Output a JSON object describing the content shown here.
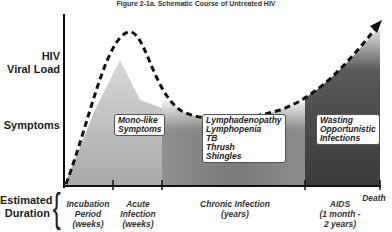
{
  "title": "Figure 2-1a. Schematic Course of Untreated HIV",
  "y_labels": {
    "viral_load": [
      "HIV",
      "Viral Load"
    ],
    "symptoms": "Symptoms",
    "duration": [
      "Estimated",
      "Duration"
    ]
  },
  "symptom_boxes": {
    "acute": [
      "Mono-like",
      "Symptoms"
    ],
    "chronic": [
      "Lymphadenopathy",
      "Lymphopenia",
      "TB",
      "Thrush",
      "Shingles"
    ],
    "aids": [
      "Wasting",
      "Opportunistic",
      "Infections"
    ]
  },
  "phases": [
    {
      "label": [
        "Incubation",
        "Period",
        "(weeks)"
      ]
    },
    {
      "label": [
        "Acute",
        "Infection",
        "(weeks)"
      ]
    },
    {
      "label": [
        "Chronic Infection",
        "(years)"
      ]
    },
    {
      "label": [
        "AIDS",
        "(1 month -",
        "2 years)"
      ]
    },
    {
      "label": [
        "Death"
      ]
    }
  ],
  "colors": {
    "acute_fill": "#bdbdbd",
    "chronic_fill": "#8a8a8a",
    "aids_fill": "#3e3e3e",
    "curve": "#111111"
  }
}
